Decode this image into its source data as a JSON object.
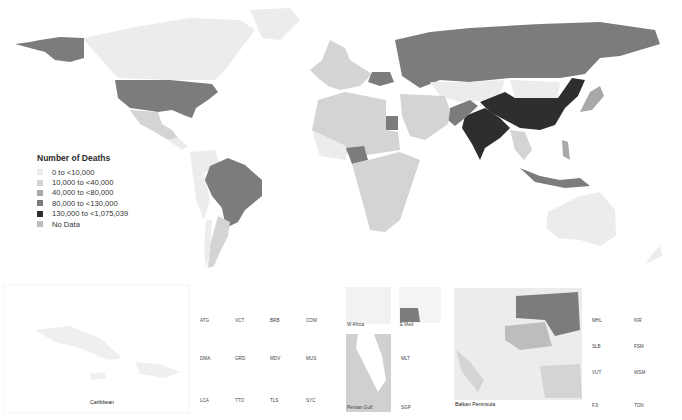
{
  "legend": {
    "title": "Number of Deaths",
    "items": [
      {
        "label": "0 to <10,000",
        "color": "#ececec"
      },
      {
        "label": "10,000 to <40,000",
        "color": "#d4d4d4"
      },
      {
        "label": "40,000 to <80,000",
        "color": "#a8a8a8"
      },
      {
        "label": "80,000 to <130,000",
        "color": "#7c7c7c"
      },
      {
        "label": "130,000 to <1,075,039",
        "color": "#2e2e2e"
      },
      {
        "label": "No Data",
        "color": "#bdbdbd"
      }
    ]
  },
  "countries": [
    {
      "name": "United States",
      "category": "80,000 to <130,000"
    },
    {
      "name": "Alaska",
      "category": "80,000 to <130,000"
    },
    {
      "name": "Canada",
      "category": "0 to <10,000"
    },
    {
      "name": "Mexico",
      "category": "10,000 to <40,000"
    },
    {
      "name": "Brazil",
      "category": "80,000 to <130,000"
    },
    {
      "name": "Argentina",
      "category": "10,000 to <40,000"
    },
    {
      "name": "Russia",
      "category": "80,000 to <130,000"
    },
    {
      "name": "China",
      "category": "130,000 to <1,075,039"
    },
    {
      "name": "India",
      "category": "130,000 to <1,075,039"
    },
    {
      "name": "Pakistan",
      "category": "80,000 to <130,000"
    },
    {
      "name": "Egypt",
      "category": "80,000 to <130,000"
    },
    {
      "name": "Nigeria",
      "category": "80,000 to <130,000"
    },
    {
      "name": "Indonesia",
      "category": "80,000 to <130,000"
    },
    {
      "name": "Ukraine",
      "category": "80,000 to <130,000"
    },
    {
      "name": "Australia",
      "category": "0 to <10,000"
    }
  ],
  "insets": {
    "caribbean": "Caribbean",
    "small_states": [
      [
        "ATG",
        "VCT",
        "BRB",
        "COM"
      ],
      [
        "DMA",
        "GRD",
        "MDV",
        "MUS"
      ],
      [
        "LCA",
        "TTO",
        "TLS",
        "SYC"
      ]
    ],
    "w_africa": "W Africa",
    "e_med": "E Med",
    "persian_gulf": "Persian Gulf",
    "mlt": "MLT",
    "sgp": "SGP",
    "balkan": "Balkan Peninsula",
    "pacific": [
      [
        "MHL",
        "KIR"
      ],
      [
        "SLB",
        "FSM"
      ],
      [
        "VUT",
        "WSM"
      ],
      [
        "FJI",
        "TON"
      ]
    ]
  }
}
